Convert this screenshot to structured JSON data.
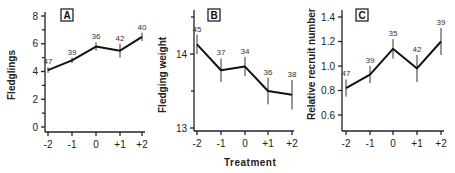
{
  "chart_data": [
    {
      "type": "line",
      "panel_label": "A",
      "title": "",
      "xlabel": "",
      "ylabel": "Fledglings",
      "categories": [
        "-2",
        "-1",
        "0",
        "+1",
        "+2"
      ],
      "values": [
        4.1,
        4.8,
        5.8,
        5.5,
        6.5
      ],
      "error": [
        0.2,
        0.2,
        0.3,
        0.5,
        0.3
      ],
      "sample_sizes": [
        "47",
        "39",
        "36",
        "42",
        "40"
      ],
      "yticks": [
        "0",
        "2",
        "4",
        "6",
        "8"
      ],
      "ylim": [
        0,
        8
      ],
      "grid": false
    },
    {
      "type": "line",
      "panel_label": "B",
      "title": "",
      "xlabel": "Treatment",
      "ylabel": "Fledging  weight",
      "categories": [
        "-2",
        "-1",
        "0",
        "+1",
        "+2"
      ],
      "values": [
        14.13,
        13.78,
        13.83,
        13.5,
        13.45
      ],
      "error": [
        0.13,
        0.16,
        0.13,
        0.18,
        0.2
      ],
      "sample_sizes": [
        "45",
        "37",
        "34",
        "36",
        "38"
      ],
      "yticks": [
        "13",
        "14"
      ],
      "ylim": [
        13,
        14.5
      ],
      "grid": false
    },
    {
      "type": "line",
      "panel_label": "C",
      "title": "",
      "xlabel": "",
      "ylabel": "Relative recruit number",
      "categories": [
        "-2",
        "-1",
        "0",
        "+1",
        "+2"
      ],
      "values": [
        0.82,
        0.93,
        1.14,
        0.98,
        1.2
      ],
      "error": [
        0.07,
        0.07,
        0.08,
        0.11,
        0.11
      ],
      "sample_sizes": [
        "47",
        "39",
        "35",
        "42",
        "39"
      ],
      "yticks": [
        "0.6",
        "0.8",
        "1.0",
        "1.2",
        "1.4"
      ],
      "ylim": [
        0.5,
        1.4
      ],
      "grid": false
    }
  ]
}
